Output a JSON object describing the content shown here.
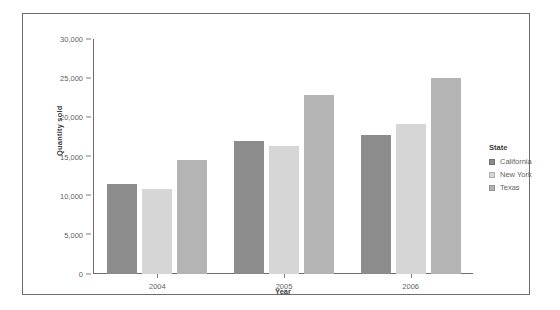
{
  "chart_data": {
    "type": "bar",
    "title": "",
    "xlabel": "Year",
    "ylabel": "Quantity sold",
    "categories": [
      "2004",
      "2005",
      "2006"
    ],
    "series": [
      {
        "name": "California",
        "color": "#8c8c8c",
        "values": [
          11500,
          17000,
          17700
        ]
      },
      {
        "name": "New York",
        "color": "#d6d6d6",
        "values": [
          10800,
          16400,
          19200
        ]
      },
      {
        "name": "Texas",
        "color": "#b4b4b4",
        "values": [
          14500,
          22800,
          25000
        ]
      }
    ],
    "ylim": [
      0,
      30000
    ],
    "yticks": [
      0,
      5000,
      10000,
      15000,
      20000,
      25000,
      30000
    ],
    "ytick_labels": [
      "0",
      "5,000",
      "10,000",
      "15,000",
      "20,000",
      "25,000",
      "30,000"
    ],
    "grid": false,
    "legend_position": "right",
    "legend_title": "State"
  },
  "axes": {
    "y_title": "Quantity sold",
    "x_title": "Year"
  },
  "legend": {
    "title": "State",
    "items": [
      {
        "label": "California",
        "color": "#8c8c8c"
      },
      {
        "label": "New York",
        "color": "#d6d6d6"
      },
      {
        "label": "Texas",
        "color": "#b4b4b4"
      }
    ]
  },
  "top_strip": {
    "text": ""
  }
}
